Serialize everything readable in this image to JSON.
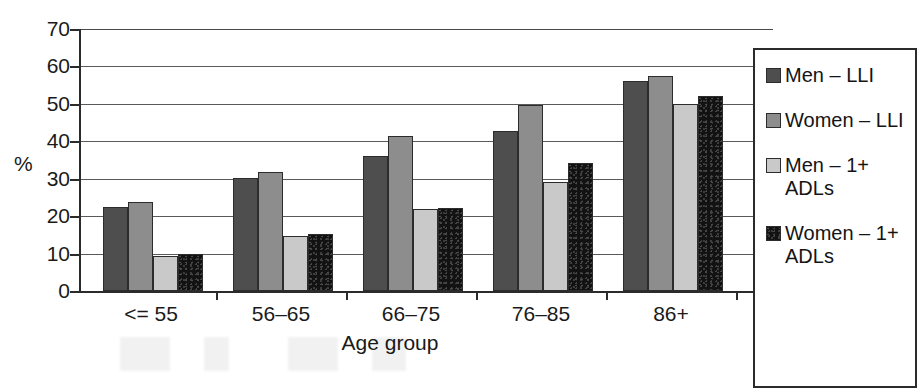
{
  "chart_data": {
    "type": "bar",
    "title": "",
    "subtitle": "",
    "xlabel": "Age group",
    "ylabel": "%",
    "categories": [
      "<= 55",
      "56–65",
      "66–75",
      "76–85",
      "86+"
    ],
    "series": [
      {
        "name": "Men – LLI",
        "color": "#4e4e4e",
        "values": [
          22.5,
          30.3,
          36.0,
          42.7,
          56.0
        ]
      },
      {
        "name": "Women – LLI",
        "color": "#8d8d8d",
        "values": [
          23.9,
          31.7,
          41.5,
          49.7,
          57.4
        ]
      },
      {
        "name": "Men – 1+ ADLs",
        "color": "#c9c9c9",
        "values": [
          9.4,
          14.8,
          22.0,
          29.0,
          50.0
        ]
      },
      {
        "name": "Women – 1+ ADLs",
        "color": "#121212",
        "values": [
          10.0,
          15.2,
          22.3,
          34.2,
          52.2
        ]
      }
    ],
    "ylim": [
      0,
      70
    ],
    "ytick_step": 10,
    "yticks": [
      0,
      10,
      20,
      30,
      40,
      50,
      60,
      70
    ],
    "ytick_labels": [
      "0",
      "10",
      "20",
      "30",
      "40",
      "50",
      "60",
      "70"
    ],
    "grid": true,
    "grid_axis": "y",
    "legend_position": "right",
    "legend_entries": [
      "Men – LLI",
      "Women – LLI",
      "Men – 1+ ADLs",
      "Women – 1+ ADLs"
    ]
  }
}
